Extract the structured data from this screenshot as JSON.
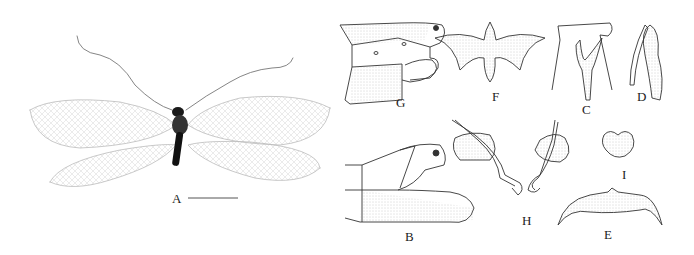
{
  "figure": {
    "panels": [
      {
        "id": "A",
        "label": "A",
        "description": "habitus dorsal view with scale bar"
      },
      {
        "id": "B",
        "label": "B",
        "description": "male terminalia lateral"
      },
      {
        "id": "C",
        "label": "C",
        "description": "gonarcus complex"
      },
      {
        "id": "D",
        "label": "D",
        "description": "paramere lateral"
      },
      {
        "id": "E",
        "label": "E",
        "description": "sclerite"
      },
      {
        "id": "F",
        "label": "F",
        "description": "gonarcus dorsal"
      },
      {
        "id": "G",
        "label": "G",
        "description": "female terminalia lateral"
      },
      {
        "id": "H",
        "label": "H",
        "description": "spermatheca"
      },
      {
        "id": "I",
        "label": "I",
        "description": "subgenitale"
      }
    ]
  }
}
